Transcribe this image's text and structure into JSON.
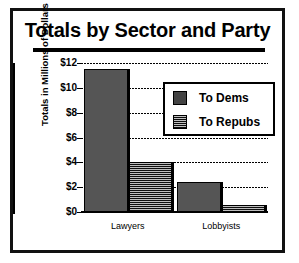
{
  "chart_data": {
    "type": "bar",
    "title": "Totals by Sector and Party",
    "xlabel": "",
    "ylabel": "Totals in Millions of Dollars",
    "categories": [
      "Lawyers",
      "Lobbyists"
    ],
    "series": [
      {
        "name": "To Dems",
        "values": [
          11.5,
          2.4
        ]
      },
      {
        "name": "To Repubs",
        "values": [
          4.0,
          0.6
        ]
      }
    ],
    "ylim": [
      0,
      12
    ],
    "yticks": [
      0,
      2,
      4,
      6,
      8,
      10,
      12
    ],
    "ytick_labels": [
      "$0",
      "$2",
      "$4",
      "$6",
      "$8",
      "$10",
      "$12"
    ],
    "grid": true,
    "legend_position": "upper right"
  },
  "legend": {
    "items": [
      {
        "label": "To Dems",
        "swatch": "light-dither-swatch"
      },
      {
        "label": "To Repubs",
        "swatch": "dark-dither-swatch"
      }
    ]
  }
}
